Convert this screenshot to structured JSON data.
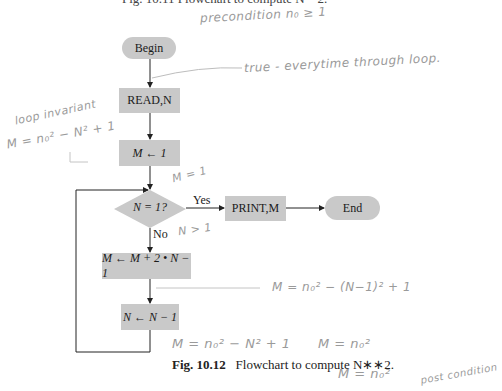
{
  "top_caption_cut": "Fig. 10.11  Flowchart to compute N**2.",
  "flowchart": {
    "begin": "Begin",
    "read": "READ,N",
    "init": "M ← 1",
    "decision": "N = 1?",
    "yes_label": "Yes",
    "no_label": "No",
    "print": "PRINT,M",
    "end": "End",
    "update_m": "M ← M + 2 • N − 1",
    "update_n": "N ← N − 1"
  },
  "caption": {
    "number": "Fig. 10.12",
    "text": "Flowchart to compute N∗∗2."
  },
  "annotations": {
    "precondition": "precondition  n₀ ≥ 1",
    "loop_true": "true - everytime through loop.",
    "loop_invariant_label": "loop invariant",
    "loop_invariant_formula": "M = n₀² − N² + 1",
    "m_equals_1": "M = 1",
    "n_gt_1": "N > 1",
    "after_update_m": "M = n₀² − (N−1)² + 1",
    "after_loop_formula": "M = n₀² − N² + 1",
    "m_equals_n0_sq": "M = n₀²",
    "postcondition_formula": "M = n₀²",
    "postcondition_label": "post condition"
  }
}
